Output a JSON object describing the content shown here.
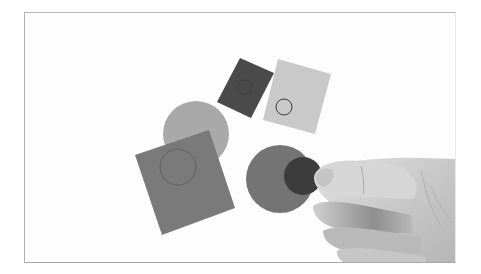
{
  "photo": {
    "description": "Grayscale photograph of paper cutout shapes on white surface, a hand holding a small dark circle over a larger gray circle",
    "colors": {
      "background": "#fdfdfd",
      "frame_border": "#b0b0b0",
      "dark_rect": "#4a4a4a",
      "light_rect": "#c9c9c9",
      "mid_circle": "#a9a9a9",
      "large_square": "#7a7a7a",
      "gray_circle": "#747474",
      "dark_circle": "#3c3c3c",
      "hand_skin": "#cfcfcf"
    },
    "shapes": [
      {
        "name": "dark-rectangle",
        "kind": "rect"
      },
      {
        "name": "light-rectangle-with-outline-circle",
        "kind": "rect"
      },
      {
        "name": "light-gray-circle",
        "kind": "circle"
      },
      {
        "name": "large-square-with-outline-circle",
        "kind": "rect"
      },
      {
        "name": "medium-gray-circle",
        "kind": "circle"
      },
      {
        "name": "small-dark-circle",
        "kind": "circle"
      },
      {
        "name": "hand",
        "kind": "hand"
      }
    ]
  }
}
